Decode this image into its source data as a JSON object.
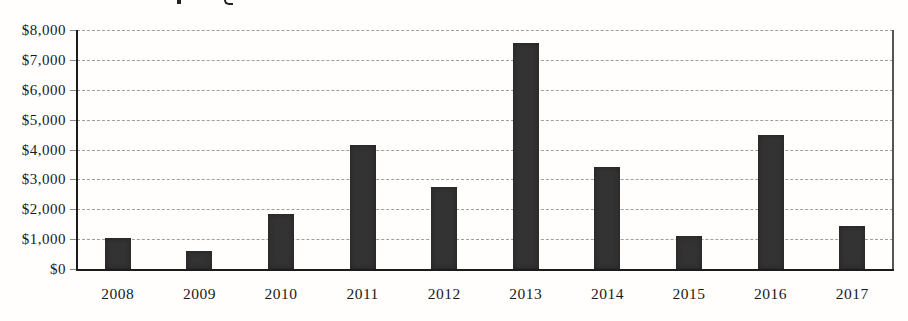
{
  "chart_data": {
    "type": "bar",
    "title": "",
    "title_note": "title cropped out of frame; only two letter-descender fragments visible at top edge",
    "categories": [
      "2008",
      "2009",
      "2010",
      "2011",
      "2012",
      "2013",
      "2014",
      "2015",
      "2016",
      "2017"
    ],
    "values": [
      1050,
      600,
      1850,
      4150,
      2750,
      7550,
      3400,
      1100,
      4500,
      1450
    ],
    "xlabel": "",
    "ylabel": "",
    "ylim": [
      0,
      8000
    ],
    "y_tick_step": 1000,
    "y_tick_labels": [
      "$0",
      "$1,000",
      "$2,000",
      "$3,000",
      "$4,000",
      "$5,000",
      "$6,000",
      "$7,000",
      "$8,000"
    ],
    "value_format": "USD",
    "grid": "horizontal-dashed",
    "legend": "none",
    "bar_color": "#333333",
    "axis_color": "#1c1c1c",
    "gridline_color": "#9e9e9e"
  }
}
